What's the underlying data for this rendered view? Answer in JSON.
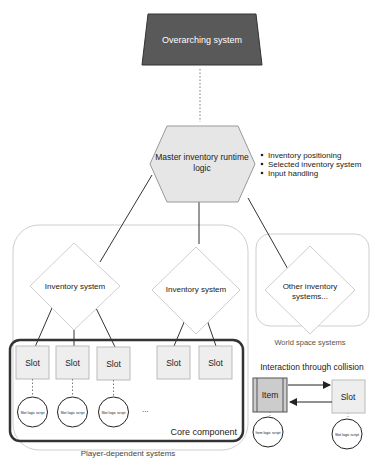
{
  "top": {
    "label": "Overarching system"
  },
  "master": {
    "label_line1": "Master inventory runtime",
    "label_line2": "logic",
    "bullets": [
      "Inventory positioning",
      "Selected inventory system",
      "Input handling"
    ]
  },
  "groups": {
    "player": "Player-dependent systems",
    "world": "World space systems",
    "core": "Core component"
  },
  "inventory_systems": [
    "Inventory system",
    "Inventory system"
  ],
  "other_systems": {
    "line1": "Other inventory",
    "line2": "systems..."
  },
  "slots": {
    "label": "Slot",
    "script_label": "Slot logic script",
    "ellipsis": "..."
  },
  "collision": {
    "title": "Interaction through collision",
    "item_label": "Item",
    "slot_label": "Slot",
    "item_script": "Item logic script",
    "slot_script": "Slot logic script"
  },
  "colors": {
    "top_fill": "#595959",
    "hex_fill": "#e6e6e6",
    "slot_fill": "#eeeeee",
    "item_fill": "#cccccc",
    "core_stroke": "#333333"
  }
}
